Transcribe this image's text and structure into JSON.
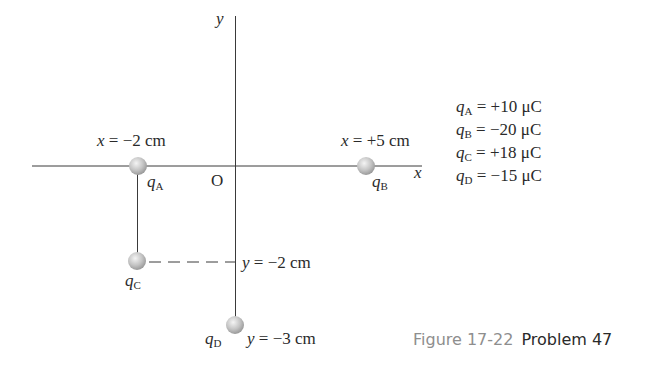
{
  "axes": {
    "x_label": "x",
    "y_label": "y",
    "origin_label": "O"
  },
  "charges": [
    {
      "name": "q",
      "sub": "A",
      "position_label_var": "x",
      "position_label": " = −2 cm",
      "value": "+10 μC"
    },
    {
      "name": "q",
      "sub": "B",
      "position_label_var": "x",
      "position_label": " = +5 cm",
      "value": "−20 μC"
    },
    {
      "name": "q",
      "sub": "C",
      "position_label_var": "y",
      "position_label": " = −2 cm",
      "value": "+18 μC"
    },
    {
      "name": "q",
      "sub": "D",
      "position_label_var": "y",
      "position_label": " = −3 cm",
      "value": "−15 μC"
    }
  ],
  "legend": [
    {
      "name": "q",
      "sub": "A",
      "text": " = +10 μC"
    },
    {
      "name": "q",
      "sub": "B",
      "text": " = −20 μC"
    },
    {
      "name": "q",
      "sub": "C",
      "text": " = +18 μC"
    },
    {
      "name": "q",
      "sub": "D",
      "text": " = −15 μC"
    }
  ],
  "caption": {
    "figure": "Figure 17-22",
    "problem": "Problem 47"
  },
  "colors": {
    "line": "#3a3a3a",
    "sphere_light": "#eeeeee",
    "sphere_dark": "#9a9a9a",
    "caption_gray": "#8e8e8e"
  }
}
